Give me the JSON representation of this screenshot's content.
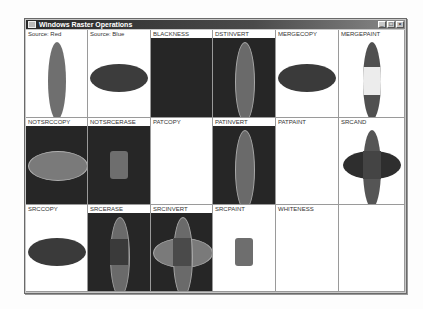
{
  "window": {
    "title": "Windows Raster Operations",
    "controls": {
      "minimize": "_",
      "maximize": "□",
      "close": "×"
    }
  },
  "colors": {
    "red_gray": "#6f6f6f",
    "blue_gray": "#3c3c3c",
    "black": "#262626",
    "white": "#ffffff",
    "light": "#e8e8e8",
    "mid": "#7a7a7a",
    "dark_overlap": "#4a4a4a",
    "outline": "#b0b0b0"
  },
  "cells": [
    {
      "label": "Source: Red"
    },
    {
      "label": "Source: Blue"
    },
    {
      "label": "BLACKNESS"
    },
    {
      "label": "DSTINVERT"
    },
    {
      "label": "MERGECOPY"
    },
    {
      "label": "MERGEPAINT"
    },
    {
      "label": "NOTSRCCOPY"
    },
    {
      "label": "NOTSRCERASE"
    },
    {
      "label": "PATCOPY"
    },
    {
      "label": "PATINVERT"
    },
    {
      "label": "PATPAINT"
    },
    {
      "label": "SRCAND"
    },
    {
      "label": "SRCCOPY"
    },
    {
      "label": "SRCERASE"
    },
    {
      "label": "SRCINVERT"
    },
    {
      "label": "SRCPAINT"
    },
    {
      "label": "WHITENESS"
    },
    {
      "label": ""
    }
  ]
}
